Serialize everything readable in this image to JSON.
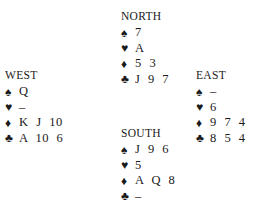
{
  "hands": {
    "north": {
      "title": "NORTH",
      "suits": [
        {
          "icon": "♠",
          "name": "spade",
          "cards": "7"
        },
        {
          "icon": "♥",
          "name": "heart",
          "cards": "A"
        },
        {
          "icon": "♦",
          "name": "diamond",
          "cards": "5 3"
        },
        {
          "icon": "♣",
          "name": "club",
          "cards": "J 9 7"
        }
      ]
    },
    "west": {
      "title": "WEST",
      "suits": [
        {
          "icon": "♠",
          "name": "spade",
          "cards": "Q"
        },
        {
          "icon": "♥",
          "name": "heart",
          "cards": "–"
        },
        {
          "icon": "♦",
          "name": "diamond",
          "cards": "K J 10"
        },
        {
          "icon": "♣",
          "name": "club",
          "cards": "A 10 6"
        }
      ]
    },
    "east": {
      "title": "EAST",
      "suits": [
        {
          "icon": "♠",
          "name": "spade",
          "cards": "–"
        },
        {
          "icon": "♥",
          "name": "heart",
          "cards": "6"
        },
        {
          "icon": "♦",
          "name": "diamond",
          "cards": "9 7 4"
        },
        {
          "icon": "♣",
          "name": "club",
          "cards": "8 5 4"
        }
      ]
    },
    "south": {
      "title": "SOUTH",
      "suits": [
        {
          "icon": "♠",
          "name": "spade",
          "cards": "J 9 6"
        },
        {
          "icon": "♥",
          "name": "heart",
          "cards": "5"
        },
        {
          "icon": "♦",
          "name": "diamond",
          "cards": "A Q 8"
        },
        {
          "icon": "♣",
          "name": "club",
          "cards": "–"
        }
      ]
    }
  }
}
